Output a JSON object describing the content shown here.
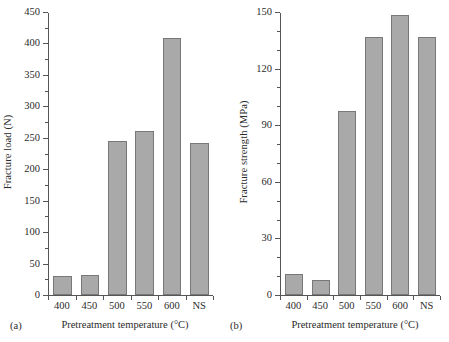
{
  "chart_data": [
    {
      "type": "bar",
      "panel_label": "(a)",
      "title": "",
      "xlabel": "Pretreatment temperature (°C)",
      "ylabel": "Fracture load (N)",
      "categories": [
        "400",
        "450",
        "500",
        "550",
        "600",
        "NS"
      ],
      "values": [
        30,
        32,
        246,
        261,
        410,
        242
      ],
      "ylim": [
        0,
        450
      ],
      "ytick_labels": [
        "0",
        "50",
        "100",
        "150",
        "200",
        "250",
        "300",
        "350",
        "400",
        "450"
      ],
      "ytick_values": [
        0,
        50,
        100,
        150,
        200,
        250,
        300,
        350,
        400,
        450
      ],
      "yminor_values": [
        25,
        75,
        125,
        175,
        225,
        275,
        325,
        375,
        425
      ],
      "grid": false,
      "legend": "none",
      "bar_fill": "#a9a9a9",
      "bar_edge": "#787878"
    },
    {
      "type": "bar",
      "panel_label": "(b)",
      "title": "",
      "xlabel": "Pretreatment temperature (°C)",
      "ylabel": "Fracture strength (MPa)",
      "categories": [
        "400",
        "450",
        "500",
        "550",
        "600",
        "NS"
      ],
      "values": [
        11,
        8,
        98,
        137,
        149,
        137
      ],
      "ylim": [
        0,
        150
      ],
      "ytick_labels": [
        "0",
        "30",
        "60",
        "90",
        "120",
        "150"
      ],
      "ytick_values": [
        0,
        30,
        60,
        90,
        120,
        150
      ],
      "yminor_values": [
        10,
        20,
        40,
        50,
        70,
        80,
        100,
        110,
        130,
        140
      ],
      "grid": false,
      "legend": "none",
      "bar_fill": "#a9a9a9",
      "bar_edge": "#787878"
    }
  ],
  "figure": {
    "background": "#ffffff",
    "text_color": "#2b2b2b",
    "axis_color": "#555555"
  }
}
